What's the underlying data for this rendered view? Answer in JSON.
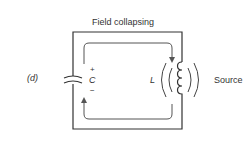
{
  "figure": {
    "panel_label": "(d)",
    "title": "Field collapsing",
    "capacitor": {
      "symbol": "C",
      "plus": "+",
      "minus": "−"
    },
    "inductor": {
      "symbol": "L"
    },
    "source_label": "Source",
    "colors": {
      "wire": "#333333",
      "arrow": "#555555"
    }
  }
}
